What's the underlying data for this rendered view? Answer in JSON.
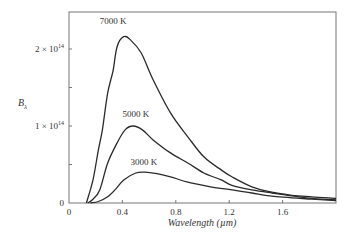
{
  "chart_data": {
    "type": "line",
    "title": "",
    "xlabel": "Wavelength (µm)",
    "ylabel_main": "B",
    "ylabel_sub": "λ",
    "xlim": [
      0,
      2.0
    ],
    "ylim": [
      0,
      250000000000000.0
    ],
    "grid": false,
    "legend": "none (curves labeled inline)",
    "x_ticks": [
      {
        "value": 0,
        "label": "0"
      },
      {
        "value": 0.4,
        "label": "0.4"
      },
      {
        "value": 0.8,
        "label": "0.8"
      },
      {
        "value": 1.2,
        "label": "1.2"
      },
      {
        "value": 1.6,
        "label": "1.6"
      }
    ],
    "y_ticks": [
      {
        "value": 0,
        "label": "0"
      },
      {
        "value": 50000000000000.0,
        "label": ""
      },
      {
        "value": 100000000000000.0,
        "label": "1 × 10",
        "exp": "14"
      },
      {
        "value": 150000000000000.0,
        "label": ""
      },
      {
        "value": 200000000000000.0,
        "label": "2 × 10",
        "exp": "14"
      }
    ],
    "series": [
      {
        "name": "7000 K",
        "label": "7000 K",
        "label_at": [
          0.33,
          233000000000000.0
        ],
        "x": [
          0.13,
          0.18,
          0.22,
          0.25,
          0.29,
          0.33,
          0.36,
          0.41,
          0.46,
          0.54,
          0.63,
          0.76,
          0.89,
          1.01,
          1.14,
          1.22,
          1.37,
          1.52,
          1.67,
          1.82,
          2.0
        ],
        "y": [
          0,
          30000000000000.0,
          69000000000000.0,
          95000000000000.0,
          143000000000000.0,
          172000000000000.0,
          203000000000000.0,
          216000000000000.0,
          212000000000000.0,
          195000000000000.0,
          160000000000000.0,
          117000000000000.0,
          86000000000000.0,
          60000000000000.0,
          43000000000000.0,
          34000000000000.0,
          21000000000000.0,
          14000000000000.0,
          10000000000000.0,
          8000000000000.0,
          6000000000000.0
        ]
      },
      {
        "name": "5000 K",
        "label": "5000 K",
        "label_at": [
          0.5,
          112000000000000.0
        ],
        "x": [
          0.14,
          0.18,
          0.23,
          0.29,
          0.36,
          0.42,
          0.48,
          0.55,
          0.63,
          0.76,
          0.89,
          1.01,
          1.14,
          1.22,
          1.37,
          1.52,
          1.82,
          2.0
        ],
        "y": [
          0,
          5000000000000.0,
          17000000000000.0,
          52000000000000.0,
          78000000000000.0,
          95000000000000.0,
          100000000000000.0,
          95000000000000.0,
          82000000000000.0,
          65000000000000.0,
          52000000000000.0,
          39000000000000.0,
          30000000000000.0,
          23000000000000.0,
          17000000000000.0,
          13000000000000.0,
          6000000000000.0,
          4000000000000.0
        ]
      },
      {
        "name": "3000 K",
        "label": "3000 K",
        "label_at": [
          0.56,
          50000000000000.0
        ],
        "x": [
          0.16,
          0.22,
          0.29,
          0.35,
          0.41,
          0.5,
          0.57,
          0.66,
          0.76,
          0.89,
          1.06,
          1.22,
          1.37,
          1.52,
          1.82,
          2.0
        ],
        "y": [
          0,
          2000000000000.0,
          8000000000000.0,
          18000000000000.0,
          30000000000000.0,
          39000000000000.0,
          40000000000000.0,
          38000000000000.0,
          34000000000000.0,
          27000000000000.0,
          21000000000000.0,
          17000000000000.0,
          13000000000000.0,
          9000000000000.0,
          5000000000000.0,
          3000000000000.0
        ]
      }
    ]
  },
  "colors": {
    "curve": "#2a2a2a",
    "frame": "#777777",
    "text": "#333333"
  }
}
